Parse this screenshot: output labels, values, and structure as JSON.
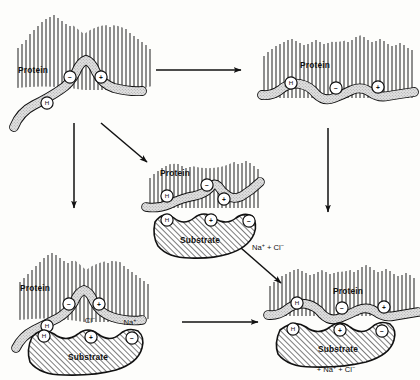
{
  "figure": {
    "type": "diagram",
    "title": "",
    "domain": "biochemistry-mechanism-schematic",
    "background_color": "#fdfdfb",
    "ink_color": "#111111",
    "ribbon_fill": "#d9d9d9",
    "substrate_fill": "#ffffff",
    "hatch_color": "#222222"
  },
  "panels": [
    {
      "id": "p1",
      "position": "top-left",
      "protein_label": "Protein",
      "state": "strained-bulged",
      "has_substrate": false,
      "ribbon_markers": [
        {
          "symbol": "−",
          "name": "negative-charge"
        },
        {
          "symbol": "+",
          "name": "positive-charge"
        },
        {
          "symbol": "H",
          "name": "hydrogen-bond-site"
        }
      ],
      "substrate_label": "",
      "substrate_markers": [],
      "ion_labels": []
    },
    {
      "id": "p2",
      "position": "top-right",
      "protein_label": "Protein",
      "state": "relaxed-wavy",
      "has_substrate": false,
      "ribbon_markers": [
        {
          "symbol": "H",
          "name": "hydrogen-bond-site"
        },
        {
          "symbol": "−",
          "name": "negative-charge"
        },
        {
          "symbol": "+",
          "name": "positive-charge"
        }
      ],
      "substrate_label": "",
      "substrate_markers": [],
      "ion_labels": []
    },
    {
      "id": "p3",
      "position": "middle-center",
      "protein_label": "Protein",
      "state": "strained-bound",
      "has_substrate": true,
      "ribbon_markers": [
        {
          "symbol": "H",
          "name": "hydrogen-bond-site"
        },
        {
          "symbol": "−",
          "name": "negative-charge"
        },
        {
          "symbol": "+",
          "name": "positive-charge"
        }
      ],
      "substrate_label": "Substrate",
      "substrate_markers": [
        {
          "symbol": "H",
          "name": "hydrogen-bond-site"
        },
        {
          "symbol": "+",
          "name": "positive-charge"
        },
        {
          "symbol": "−",
          "name": "negative-charge"
        }
      ],
      "ion_labels": []
    },
    {
      "id": "p4",
      "position": "bottom-left",
      "protein_label": "Protein",
      "state": "strained-bulged-with-ions",
      "has_substrate": true,
      "ribbon_markers": [
        {
          "symbol": "−",
          "name": "negative-charge"
        },
        {
          "symbol": "+",
          "name": "positive-charge"
        },
        {
          "symbol": "H",
          "name": "hydrogen-bond-site"
        }
      ],
      "substrate_label": "Substrate",
      "substrate_markers": [
        {
          "symbol": "H",
          "name": "hydrogen-bond-site"
        },
        {
          "symbol": "+",
          "name": "positive-charge"
        },
        {
          "symbol": "−",
          "name": "negative-charge"
        }
      ],
      "ion_labels": [
        {
          "base": "Cl",
          "sup": "−",
          "name": "chloride-ion-label"
        },
        {
          "base": "Na",
          "sup": "+",
          "name": "sodium-ion-label"
        }
      ]
    },
    {
      "id": "p5",
      "position": "bottom-right",
      "protein_label": "Protein",
      "state": "relaxed-bound-complex",
      "has_substrate": true,
      "ribbon_markers": [
        {
          "symbol": "H",
          "name": "hydrogen-bond-site"
        },
        {
          "symbol": "−",
          "name": "negative-charge"
        },
        {
          "symbol": "+",
          "name": "positive-charge"
        }
      ],
      "substrate_label": "Substrate",
      "substrate_markers": [
        {
          "symbol": "H",
          "name": "hydrogen-bond-site"
        },
        {
          "symbol": "+",
          "name": "positive-charge"
        },
        {
          "symbol": "−",
          "name": "negative-charge"
        }
      ],
      "ion_labels": [
        {
          "base": "+ Na",
          "sup": "+",
          "name": "sodium-ion-product"
        },
        {
          "base": " + Cl",
          "sup": "−",
          "name": "chloride-ion-product"
        }
      ]
    }
  ],
  "arrows": [
    {
      "id": "a1",
      "name": "arrow-top-left-to-top-right",
      "from": "p1",
      "to": "p2",
      "orientation": "horizontal-right",
      "label": ""
    },
    {
      "id": "a2",
      "name": "arrow-top-left-to-bottom-left",
      "from": "p1",
      "to": "p4",
      "orientation": "vertical-down",
      "label": ""
    },
    {
      "id": "a3",
      "name": "arrow-top-left-to-middle",
      "from": "p1",
      "to": "p3",
      "orientation": "diagonal-down-right",
      "label": ""
    },
    {
      "id": "a4",
      "name": "arrow-top-right-to-bottom-right",
      "from": "p2",
      "to": "p5",
      "orientation": "vertical-down",
      "label": ""
    },
    {
      "id": "a5",
      "name": "arrow-middle-to-bottom-right",
      "from": "p3",
      "to": "p5",
      "orientation": "diagonal-down-right",
      "label_base_1": "Na",
      "label_sup_1": "+",
      "label_mid": " + ",
      "label_base_2": "Cl",
      "label_sup_2": "−"
    },
    {
      "id": "a6",
      "name": "arrow-bottom-left-to-bottom-right",
      "from": "p4",
      "to": "p5",
      "orientation": "horizontal-right",
      "label": ""
    }
  ]
}
